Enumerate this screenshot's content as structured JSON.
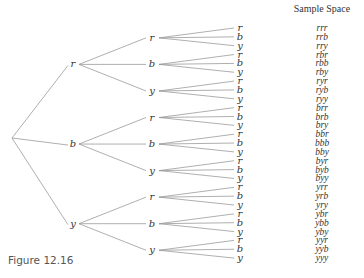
{
  "figure_caption": "Figure 12.16",
  "sample_space_header": "Sample Space",
  "tree": {
    "root": "",
    "level1": [
      "r",
      "b",
      "y"
    ],
    "level2": [
      "r",
      "b",
      "y",
      "r",
      "b",
      "y",
      "r",
      "b",
      "y"
    ],
    "level3": [
      "r",
      "b",
      "y",
      "r",
      "b",
      "y",
      "r",
      "b",
      "y",
      "r",
      "b",
      "y",
      "r",
      "b",
      "y",
      "r",
      "b",
      "y",
      "r",
      "b",
      "y",
      "r",
      "b",
      "y",
      "r",
      "b",
      "y"
    ]
  },
  "sample_space": [
    "rrr",
    "rrb",
    "rry",
    "rbr",
    "rbb",
    "rby",
    "ryr",
    "ryb",
    "ryy",
    "brr",
    "brb",
    "bry",
    "bbr",
    "bbb",
    "bby",
    "byr",
    "byb",
    "byy",
    "yrr",
    "yrb",
    "yry",
    "ybr",
    "ybb",
    "yby",
    "yyr",
    "yyb",
    "yyy"
  ],
  "colors": {
    "line": "#9a9a9a",
    "text": "#333333",
    "caption": "#555555"
  }
}
